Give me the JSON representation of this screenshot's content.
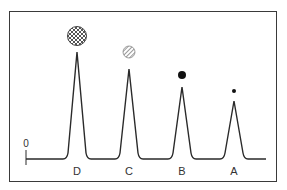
{
  "diagram": {
    "zero_label": "0",
    "peaks": [
      {
        "label": "D",
        "x": 77,
        "top_y": 52,
        "marker": "crosshatch-circle",
        "marker_cx": 77,
        "marker_cy": 36,
        "marker_r": 10
      },
      {
        "label": "C",
        "x": 129,
        "top_y": 69,
        "marker": "hatched-circle",
        "marker_cx": 129,
        "marker_cy": 52,
        "marker_r": 6
      },
      {
        "label": "B",
        "x": 182,
        "top_y": 87,
        "marker": "solid-circle",
        "marker_cx": 182,
        "marker_cy": 75,
        "marker_r": 4
      },
      {
        "label": "A",
        "x": 234,
        "top_y": 101,
        "marker": "small-solid-circle",
        "marker_cx": 234,
        "marker_cy": 91,
        "marker_r": 2
      }
    ],
    "baseline_y": 159,
    "colors": {
      "line": "#2a2a2a",
      "frame": "#3a3a3a"
    }
  }
}
